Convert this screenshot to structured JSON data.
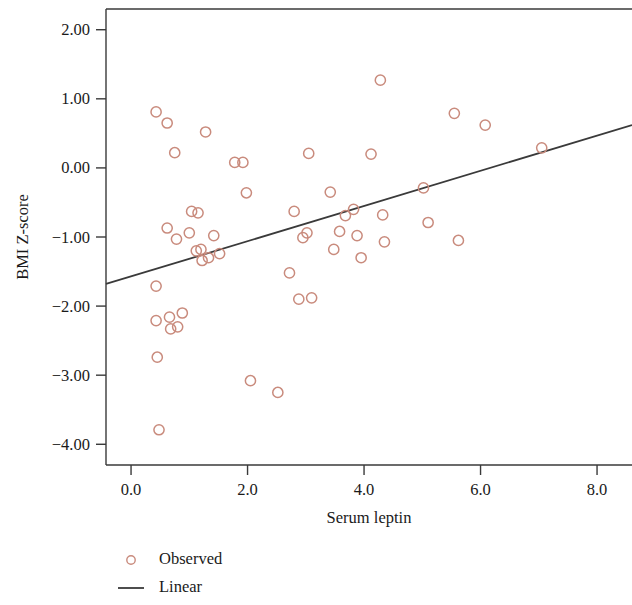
{
  "chart_data": {
    "type": "scatter",
    "title": "",
    "xlabel": "Serum leptin",
    "ylabel": "BMI Z-score",
    "xlim": [
      -0.43,
      8.6
    ],
    "ylim": [
      -4.3,
      2.3
    ],
    "xticks": [
      "0.0",
      "2.0",
      "4.0",
      "6.0",
      "8.0"
    ],
    "xtick_values": [
      0,
      2,
      4,
      6,
      8
    ],
    "yticks": [
      "2.00",
      "1.00",
      "0.00",
      "-1.00",
      "-2.00",
      "-3.00",
      "-4.00"
    ],
    "ytick_values": [
      2,
      1,
      0,
      -1,
      -2,
      -3,
      -4
    ],
    "grid": false,
    "legend_position": "below-left",
    "legend": [
      {
        "label": "Observed",
        "marker": "open-circle",
        "color": "#c98b7d"
      },
      {
        "label": "Linear",
        "marker": "line",
        "color": "#3a3a3a"
      }
    ],
    "series": [
      {
        "name": "Observed",
        "marker": "open-circle",
        "color": "#c98b7d",
        "points": [
          [
            0.43,
            0.81
          ],
          [
            0.43,
            -1.71
          ],
          [
            0.43,
            -2.21
          ],
          [
            0.45,
            -2.74
          ],
          [
            0.48,
            -3.79
          ],
          [
            0.62,
            0.65
          ],
          [
            0.62,
            -0.87
          ],
          [
            0.66,
            -2.16
          ],
          [
            0.68,
            -2.33
          ],
          [
            0.75,
            0.22
          ],
          [
            0.78,
            -1.03
          ],
          [
            0.8,
            -2.3
          ],
          [
            0.88,
            -2.1
          ],
          [
            1.0,
            -0.94
          ],
          [
            1.04,
            -0.63
          ],
          [
            1.12,
            -1.2
          ],
          [
            1.15,
            -0.65
          ],
          [
            1.2,
            -1.18
          ],
          [
            1.22,
            -1.34
          ],
          [
            1.28,
            0.52
          ],
          [
            1.33,
            -1.3
          ],
          [
            1.42,
            -0.98
          ],
          [
            1.52,
            -1.24
          ],
          [
            1.78,
            0.08
          ],
          [
            1.92,
            0.08
          ],
          [
            1.98,
            -0.36
          ],
          [
            2.05,
            -3.08
          ],
          [
            2.52,
            -3.25
          ],
          [
            2.72,
            -1.52
          ],
          [
            2.8,
            -0.63
          ],
          [
            2.88,
            -1.9
          ],
          [
            2.95,
            -1.01
          ],
          [
            3.02,
            -0.94
          ],
          [
            3.05,
            0.21
          ],
          [
            3.1,
            -1.88
          ],
          [
            3.42,
            -0.35
          ],
          [
            3.48,
            -1.18
          ],
          [
            3.58,
            -0.92
          ],
          [
            3.68,
            -0.69
          ],
          [
            3.82,
            -0.6
          ],
          [
            3.88,
            -0.98
          ],
          [
            3.95,
            -1.3
          ],
          [
            4.12,
            0.2
          ],
          [
            4.28,
            1.27
          ],
          [
            4.32,
            -0.68
          ],
          [
            4.35,
            -1.07
          ],
          [
            5.02,
            -0.29
          ],
          [
            5.1,
            -0.79
          ],
          [
            5.55,
            0.79
          ],
          [
            5.62,
            -1.05
          ],
          [
            6.08,
            0.62
          ],
          [
            7.05,
            0.29
          ]
        ]
      }
    ],
    "fit_line": {
      "name": "Linear",
      "color": "#3a3a3a",
      "x_start": -0.43,
      "y_start": -1.68,
      "x_end": 8.6,
      "y_end": 0.62
    }
  },
  "axes": {
    "ylabel": "BMI Z-score",
    "xlabel": "Serum leptin"
  }
}
